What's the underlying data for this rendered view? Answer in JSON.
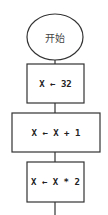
{
  "flowchart": {
    "start": {
      "label": "开始"
    },
    "steps": [
      {
        "label": "X ← 32"
      },
      {
        "label": "X ← X + 1"
      },
      {
        "label": "X ← X * 2"
      }
    ]
  }
}
